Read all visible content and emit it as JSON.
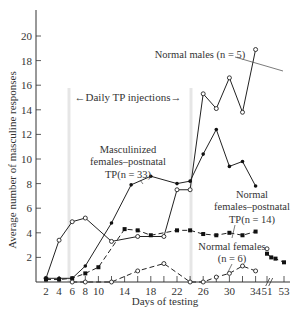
{
  "chart_data": {
    "type": "line",
    "title": "",
    "xlabel": "Days of testing",
    "ylabel": "Average number of masculine responses",
    "ylim": [
      0,
      22
    ],
    "yticks": [
      2,
      4,
      6,
      8,
      10,
      12,
      14,
      16,
      18,
      20
    ],
    "xtick_labels": [
      "2",
      "4",
      "6",
      "8",
      "10",
      "14",
      "18",
      "22",
      "26",
      "30",
      "34",
      "51",
      "53"
    ],
    "grid": false,
    "annotations": [
      {
        "text": "Daily TP injections",
        "type": "range-arrow",
        "from_day": 6,
        "to_day": 25
      }
    ],
    "series": [
      {
        "name": "Normal males (n = 5)",
        "marker": "open-circle",
        "line": "solid",
        "points": [
          [
            2,
            0.3
          ],
          [
            4,
            3.4
          ],
          [
            6,
            4.9
          ],
          [
            8,
            5.2
          ],
          [
            12,
            3.3
          ],
          [
            16,
            3.7
          ],
          [
            20,
            3.7
          ],
          [
            22,
            7.5
          ],
          [
            24,
            7.5
          ],
          [
            26,
            15.3
          ],
          [
            28,
            14.1
          ],
          [
            30,
            16.6
          ],
          [
            32,
            13.8
          ],
          [
            34,
            18.9
          ]
        ]
      },
      {
        "name": "Masculinized females-postnatal TP (n = 33)",
        "marker": "filled-circle",
        "line": "solid",
        "points": [
          [
            2,
            0.3
          ],
          [
            4,
            0.3
          ],
          [
            6,
            0.3
          ],
          [
            8,
            1.3
          ],
          [
            12,
            4.8
          ],
          [
            15,
            7.9
          ],
          [
            18,
            8.6
          ],
          [
            22,
            8.0
          ],
          [
            24,
            8.2
          ],
          [
            26,
            10.4
          ],
          [
            28,
            12.4
          ],
          [
            30,
            9.4
          ],
          [
            32,
            9.8
          ],
          [
            34,
            7.8
          ]
        ]
      },
      {
        "name": "Normal females-postnatal TP (n = 14)",
        "marker": "filled-square",
        "line": "dashed",
        "points": [
          [
            2,
            0.2
          ],
          [
            4,
            0.2
          ],
          [
            6,
            0.3
          ],
          [
            8,
            0.7
          ],
          [
            10,
            1.2
          ],
          [
            14,
            4.3
          ],
          [
            16,
            4.2
          ],
          [
            18,
            3.8
          ],
          [
            22,
            4.2
          ],
          [
            24,
            4.2
          ],
          [
            26,
            3.9
          ],
          [
            28,
            3.8
          ],
          [
            30,
            4.0
          ],
          [
            32,
            3.8
          ],
          [
            34,
            4.1
          ]
        ],
        "post_points": [
          [
            51,
            2.3
          ],
          [
            51.5,
            2.0
          ],
          [
            52,
            1.9
          ],
          [
            53,
            1.6
          ]
        ]
      },
      {
        "name": "Normal females (n = 6)",
        "marker": "open-circle",
        "line": "dashed",
        "points": [
          [
            6,
            0.0
          ],
          [
            8,
            0.0
          ],
          [
            12,
            0.0
          ],
          [
            16,
            0.9
          ],
          [
            20,
            1.5
          ],
          [
            24,
            0.0
          ],
          [
            26,
            0.0
          ],
          [
            28,
            0.4
          ],
          [
            30,
            0.7
          ],
          [
            32,
            1.3
          ],
          [
            34,
            0.9
          ]
        ],
        "post_points": [
          [
            51,
            2.7
          ]
        ]
      }
    ]
  },
  "labels": {
    "injection_arrow": "←Daily TP injections→",
    "normal_males": "Normal males (n = 5)",
    "masc_1": "Masculinized",
    "masc_2": "females–postnatal",
    "masc_3": "TP(n = 33)",
    "nf_tp_1": "Normal",
    "nf_tp_2": "females–postnatal",
    "nf_tp_3": "TP(n = 14)",
    "nf_1": "Normal females",
    "nf_2": "(n = 6)",
    "xlabel": "Days of testing",
    "ylabel": "Average number of masculine responses"
  }
}
